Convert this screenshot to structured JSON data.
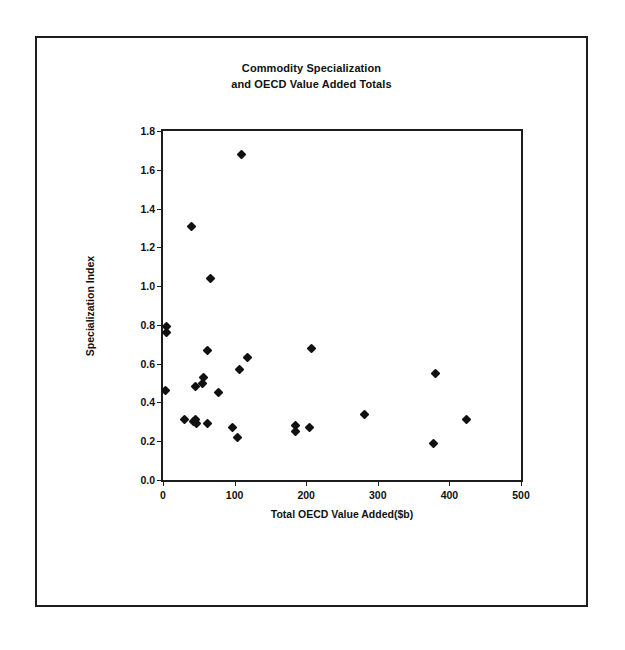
{
  "chart_data": {
    "type": "scatter",
    "title": "Commodity Specialization and OECD Value Added Totals",
    "title_lines": [
      "Commodity Specialization",
      "and OECD Value Added Totals"
    ],
    "xlabel": "Total OECD Value Added($b)",
    "ylabel": "Specialization Index",
    "xlim": [
      0,
      500
    ],
    "ylim": [
      0.0,
      1.8
    ],
    "xticks": [
      0,
      100,
      200,
      300,
      400,
      500
    ],
    "yticks": [
      "0.0",
      "0.2",
      "0.4",
      "0.6",
      "0.8",
      "1.0",
      "1.2",
      "1.4",
      "1.6",
      "1.8"
    ],
    "xtick_labels": [
      "0",
      "100",
      "200",
      "300",
      "400",
      "500"
    ],
    "grid": false,
    "legend": false,
    "marker": "diamond",
    "marker_color": "#111111",
    "points": [
      {
        "x": 5,
        "y": 0.79
      },
      {
        "x": 5,
        "y": 0.76
      },
      {
        "x": 4,
        "y": 0.46
      },
      {
        "x": 40,
        "y": 1.31
      },
      {
        "x": 110,
        "y": 1.68
      },
      {
        "x": 67,
        "y": 1.04
      },
      {
        "x": 57,
        "y": 0.53
      },
      {
        "x": 55,
        "y": 0.5
      },
      {
        "x": 45,
        "y": 0.48
      },
      {
        "x": 62,
        "y": 0.67
      },
      {
        "x": 78,
        "y": 0.45
      },
      {
        "x": 30,
        "y": 0.31
      },
      {
        "x": 43,
        "y": 0.3
      },
      {
        "x": 45,
        "y": 0.31
      },
      {
        "x": 47,
        "y": 0.29
      },
      {
        "x": 62,
        "y": 0.29
      },
      {
        "x": 97,
        "y": 0.27
      },
      {
        "x": 104,
        "y": 0.22
      },
      {
        "x": 107,
        "y": 0.57
      },
      {
        "x": 118,
        "y": 0.63
      },
      {
        "x": 185,
        "y": 0.28
      },
      {
        "x": 185,
        "y": 0.25
      },
      {
        "x": 205,
        "y": 0.27
      },
      {
        "x": 208,
        "y": 0.68
      },
      {
        "x": 281,
        "y": 0.34
      },
      {
        "x": 378,
        "y": 0.19
      },
      {
        "x": 381,
        "y": 0.55
      },
      {
        "x": 424,
        "y": 0.31
      }
    ]
  },
  "figure": {
    "background_color": "#ffffff",
    "border_color": "#1d1d1d",
    "axis_color": "#1d1d1d"
  }
}
